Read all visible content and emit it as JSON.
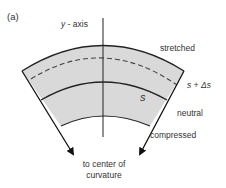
{
  "panel_label": "(a)",
  "axis": {
    "label_var": "y",
    "label_rest": " - axis"
  },
  "regions": {
    "stretched": "stretched",
    "neutral": "neutral",
    "compressed": "compressed"
  },
  "arc_labels": {
    "dashed": "s + Δs",
    "neutral": "s"
  },
  "arrow_caption": {
    "line1": "to center of",
    "line2": "curvature"
  },
  "colors": {
    "fill": "#d9d9d9",
    "stroke": "#222222",
    "text": "#333333",
    "background": "#ffffff"
  }
}
